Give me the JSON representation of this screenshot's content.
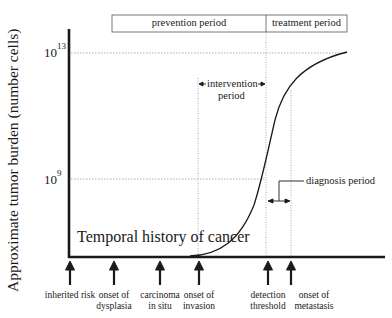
{
  "diagram": {
    "title": "Temporal history of cancer",
    "y_axis_label": "Approximate tumor burden (number cells)",
    "y_ticks": [
      {
        "base": "10",
        "exp": "13"
      },
      {
        "base": "10",
        "exp": "9"
      }
    ],
    "periods": {
      "prevention": "prevention period",
      "treatment": "treatment period",
      "intervention_line1": "intervention",
      "intervention_line2": "period",
      "diagnosis": "diagnosis period"
    },
    "events": [
      {
        "line1": "inherited risk",
        "line2": ""
      },
      {
        "line1": "onset of",
        "line2": "dysplasia"
      },
      {
        "line1": "carcinoma",
        "line2": "in situ"
      },
      {
        "line1": "onset of",
        "line2": "invasion"
      },
      {
        "line1": "detection",
        "line2": "threshold"
      },
      {
        "line1": "onset of",
        "line2": "metastasis"
      }
    ],
    "colors": {
      "line": "#1a1a1a",
      "grid": "#8a8a8a"
    }
  }
}
